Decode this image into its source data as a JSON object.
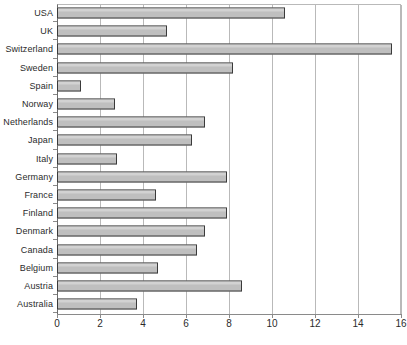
{
  "chart_data": {
    "type": "bar",
    "orientation": "horizontal",
    "title": "",
    "xlabel": "",
    "ylabel": "",
    "xlim": [
      0,
      16
    ],
    "xticks": [
      0,
      2,
      4,
      6,
      8,
      10,
      12,
      14,
      16
    ],
    "grid": true,
    "legend": false,
    "categories": [
      "USA",
      "UK",
      "Switzerland",
      "Sweden",
      "Spain",
      "Norway",
      "Netherlands",
      "Japan",
      "Italy",
      "Germany",
      "France",
      "Finland",
      "Denmark",
      "Canada",
      "Belgium",
      "Austria",
      "Australia"
    ],
    "values": [
      10.6,
      5.1,
      15.6,
      8.2,
      1.1,
      2.7,
      6.9,
      6.3,
      2.8,
      7.9,
      4.6,
      7.9,
      6.9,
      6.5,
      4.7,
      8.6,
      3.7
    ],
    "bar_color": "#bfbfbf",
    "bar_border_color": "#3a3a3a",
    "gridline_color": "#b9b9b9",
    "axis_color": "#8a8a8a"
  }
}
